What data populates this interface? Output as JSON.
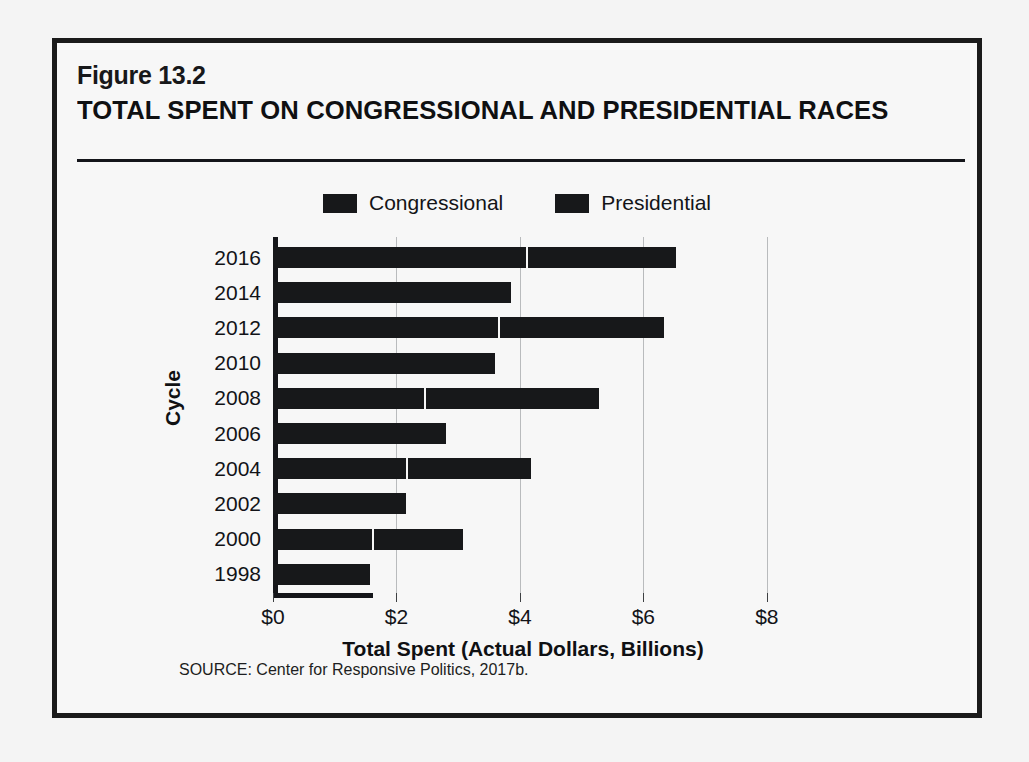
{
  "figure": {
    "number": "Figure 13.2",
    "title": "TOTAL SPENT ON CONGRESSIONAL AND PRESIDENTIAL RACES",
    "source": "SOURCE: Center for Responsive Politics, 2017b."
  },
  "colors": {
    "bar": "#17181a",
    "frame": "#1a1a1a",
    "background": "#f7f7f7",
    "gridline": "#b9bbbd"
  },
  "chart_data": {
    "type": "bar",
    "orientation": "horizontal",
    "stacked": true,
    "title": "TOTAL SPENT ON CONGRESSIONAL AND PRESIDENTIAL RACES",
    "xlabel": "Total Spent (Actual Dollars, Billions)",
    "ylabel": "Cycle",
    "xlim": [
      0,
      8.1
    ],
    "xticks": [
      0,
      2,
      4,
      6,
      8
    ],
    "xtick_labels": [
      "$0",
      "$2",
      "$4",
      "$6",
      "$8"
    ],
    "grid": "vertical",
    "legend_position": "top-center",
    "categories": [
      "2016",
      "2014",
      "2012",
      "2010",
      "2008",
      "2006",
      "2004",
      "2002",
      "2000",
      "1998"
    ],
    "series": [
      {
        "name": "Congressional",
        "values": [
          4.1,
          3.85,
          3.65,
          3.6,
          2.45,
          2.8,
          2.15,
          2.15,
          1.6,
          1.57
        ]
      },
      {
        "name": "Presidential",
        "values": [
          2.4,
          0,
          2.65,
          0,
          2.8,
          0,
          2.0,
          0,
          1.45,
          0
        ]
      }
    ],
    "totals": [
      6.5,
      3.85,
      6.3,
      3.6,
      5.25,
      2.8,
      4.15,
      2.15,
      3.05,
      1.57
    ]
  },
  "legend": [
    {
      "label": "Congressional",
      "swatch": "#17181a"
    },
    {
      "label": "Presidential",
      "swatch": "#17181a"
    }
  ]
}
